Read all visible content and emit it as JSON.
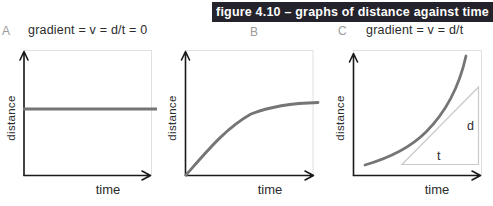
{
  "banner": {
    "text": "figure 4.10 – graphs of distance against time"
  },
  "colors": {
    "banner_bg": "#24222a",
    "banner_fg": "#ffffff",
    "axis": "#1a1a1a",
    "curve": "#757575",
    "frame": "#e0e0e0",
    "triangle": "#c9c9c9",
    "graph_label": "#9b9b9b",
    "text": "#2b2b2b"
  },
  "graphs": [
    {
      "label": "A",
      "title": "gradient = v = d/t = 0",
      "y_label": "distance",
      "x_label": "time",
      "curve_shape": "horizontal straight line (constant distance)"
    },
    {
      "label": "B",
      "title": "",
      "y_label": "distance",
      "x_label": "time",
      "curve_shape": "rising curve levelling off to horizontal"
    },
    {
      "label": "C",
      "title": "gradient = v = d/t",
      "y_label": "distance",
      "x_label": "time",
      "curve_shape": "rising curve getting steeper",
      "annotations": {
        "vertical_side": "d",
        "horizontal_side": "t"
      }
    }
  ]
}
